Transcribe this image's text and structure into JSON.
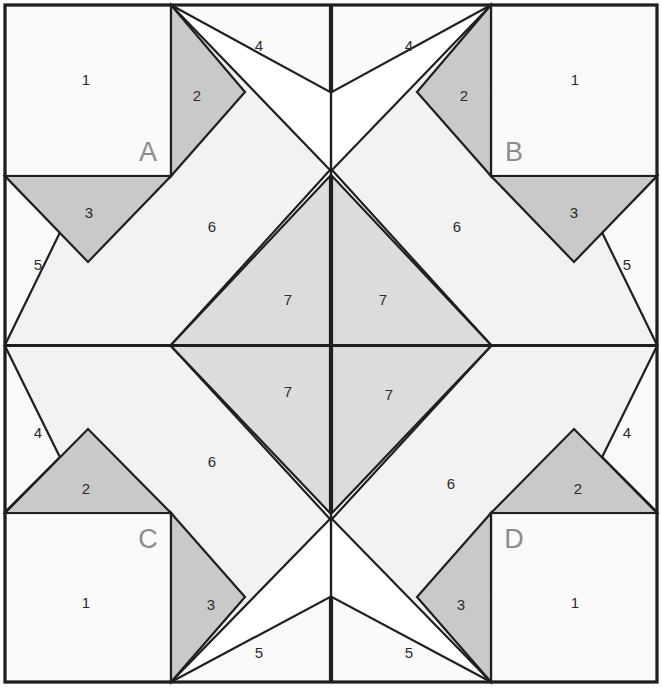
{
  "diagram": {
    "type": "quilt-block-foundation-piecing",
    "canvas": {
      "width": 662,
      "height": 693
    },
    "colors": {
      "background": "#ffffff",
      "fabric_light": "#fafafa",
      "fabric_pale": "#f2f2f2",
      "fabric_medium": "#c9c9c9",
      "fabric_center": "#dcdcdc",
      "outline": "#1f1f1f",
      "number_text": "#2b2b2b",
      "corner_text": "#8c8c8c"
    },
    "grid": {
      "x": [
        5,
        171,
        330,
        490,
        653
      ],
      "y": [
        5,
        176,
        345,
        513,
        682
      ]
    },
    "sections": [
      {
        "id": "A",
        "label": "A",
        "position": "top-left",
        "label_point": [
          148,
          154
        ],
        "orientation": "none",
        "pieces": [
          {
            "number": "1",
            "shape": "square",
            "fill": "fabric_light",
            "label_point": [
              86,
              81
            ]
          },
          {
            "number": "2",
            "shape": "triangle",
            "fill": "fabric_medium",
            "label_point": [
              197,
              97
            ]
          },
          {
            "number": "3",
            "shape": "triangle",
            "fill": "fabric_medium",
            "label_point": [
              89,
              214
            ]
          },
          {
            "number": "4",
            "shape": "triangle",
            "fill": "fabric_light",
            "label_point": [
              259,
              47
            ]
          },
          {
            "number": "5",
            "shape": "triangle",
            "fill": "fabric_light",
            "label_point": [
              38,
              266
            ]
          },
          {
            "number": "6",
            "shape": "parallelogram",
            "fill": "fabric_pale",
            "label_point": [
              212,
              228
            ]
          },
          {
            "number": "7",
            "shape": "triangle",
            "fill": "fabric_center",
            "label_point": [
              288,
              301
            ]
          }
        ]
      },
      {
        "id": "B",
        "label": "B",
        "position": "top-right",
        "label_point": [
          514,
          154
        ],
        "orientation": "mirror-horizontal",
        "pieces": [
          {
            "number": "1",
            "shape": "square",
            "fill": "fabric_light",
            "label_point": [
              575,
              81
            ]
          },
          {
            "number": "2",
            "shape": "triangle",
            "fill": "fabric_medium",
            "label_point": [
              464,
              97
            ]
          },
          {
            "number": "3",
            "shape": "triangle",
            "fill": "fabric_medium",
            "label_point": [
              574,
              214
            ]
          },
          {
            "number": "4",
            "shape": "triangle",
            "fill": "fabric_light",
            "label_point": [
              409,
              47
            ]
          },
          {
            "number": "5",
            "shape": "triangle",
            "fill": "fabric_light",
            "label_point": [
              627,
              266
            ]
          },
          {
            "number": "6",
            "shape": "parallelogram",
            "fill": "fabric_pale",
            "label_point": [
              457,
              228
            ]
          },
          {
            "number": "7",
            "shape": "triangle",
            "fill": "fabric_center",
            "label_point": [
              383,
              301
            ]
          }
        ]
      },
      {
        "id": "C",
        "label": "C",
        "position": "bottom-left",
        "label_point": [
          148,
          541
        ],
        "orientation": "mirror-vertical",
        "pieces": [
          {
            "number": "1",
            "shape": "square",
            "fill": "fabric_light",
            "label_point": [
              86,
              604
            ]
          },
          {
            "number": "2",
            "shape": "triangle",
            "fill": "fabric_medium",
            "label_point": [
              86,
              490
            ]
          },
          {
            "number": "3",
            "shape": "triangle",
            "fill": "fabric_medium",
            "label_point": [
              211,
              606
            ]
          },
          {
            "number": "4",
            "shape": "triangle",
            "fill": "fabric_light",
            "label_point": [
              38,
              434
            ]
          },
          {
            "number": "5",
            "shape": "triangle",
            "fill": "fabric_light",
            "label_point": [
              259,
              654
            ]
          },
          {
            "number": "6",
            "shape": "parallelogram",
            "fill": "fabric_pale",
            "label_point": [
              212,
              463
            ]
          },
          {
            "number": "7",
            "shape": "triangle",
            "fill": "fabric_center",
            "label_point": [
              288,
              393
            ]
          }
        ]
      },
      {
        "id": "D",
        "label": "D",
        "position": "bottom-right",
        "label_point": [
          514,
          541
        ],
        "orientation": "mirror-both",
        "pieces": [
          {
            "number": "1",
            "shape": "square",
            "fill": "fabric_light",
            "label_point": [
              575,
              604
            ]
          },
          {
            "number": "2",
            "shape": "triangle",
            "fill": "fabric_medium",
            "label_point": [
              578,
              490
            ]
          },
          {
            "number": "3",
            "shape": "triangle",
            "fill": "fabric_medium",
            "label_point": [
              461,
              606
            ]
          },
          {
            "number": "4",
            "shape": "triangle",
            "fill": "fabric_light",
            "label_point": [
              627,
              434
            ]
          },
          {
            "number": "5",
            "shape": "triangle",
            "fill": "fabric_light",
            "label_point": [
              409,
              654
            ]
          },
          {
            "number": "6",
            "shape": "parallelogram",
            "fill": "fabric_pale",
            "label_point": [
              451,
              485
            ]
          },
          {
            "number": "7",
            "shape": "triangle",
            "fill": "fabric_center",
            "label_point": [
              389,
              396
            ]
          }
        ]
      }
    ],
    "piece_numbers": [
      "1",
      "2",
      "3",
      "4",
      "5",
      "6",
      "7"
    ],
    "section_labels": [
      "A",
      "B",
      "C",
      "D"
    ]
  }
}
